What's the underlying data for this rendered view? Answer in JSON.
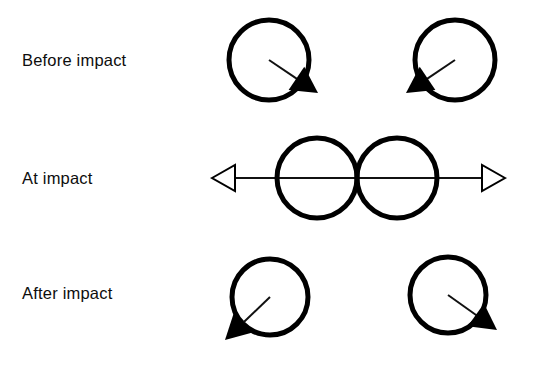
{
  "figure": {
    "background_color": "#ffffff",
    "ink_color": "#000000",
    "width": 546,
    "height": 374
  },
  "rows": [
    {
      "id": "before-impact",
      "label": "Before impact",
      "label_x": 22,
      "label_y": 66,
      "balls": [
        {
          "id": "before-left-ball",
          "cx": 269,
          "cy": 60,
          "r": 40,
          "arrow": {
            "id": "before-left-velocity-arrow",
            "from_x": 269,
            "from_y": 60,
            "to_x": 318,
            "to_y": 93,
            "head": "filled",
            "direction": "down-right"
          }
        },
        {
          "id": "before-right-ball",
          "cx": 455,
          "cy": 60,
          "r": 40,
          "arrow": {
            "id": "before-right-velocity-arrow",
            "from_x": 455,
            "from_y": 60,
            "to_x": 406,
            "to_y": 93,
            "head": "filled",
            "direction": "down-left"
          }
        }
      ]
    },
    {
      "id": "at-impact",
      "label": "At impact",
      "label_x": 22,
      "label_y": 184,
      "balls": [
        {
          "id": "at-impact-left-ball",
          "cx": 317,
          "cy": 178,
          "r": 40,
          "arrow": null
        },
        {
          "id": "at-impact-right-ball",
          "cx": 397,
          "cy": 178,
          "r": 40,
          "arrow": null
        }
      ],
      "axis": {
        "id": "line-of-impact-axis",
        "y": 178,
        "left_tip_x": 212,
        "right_tip_x": 505,
        "head": "hollow",
        "head_length": 23,
        "head_half_height": 13
      }
    },
    {
      "id": "after-impact",
      "label": "After impact",
      "label_x": 22,
      "label_y": 299,
      "balls": [
        {
          "id": "after-left-ball",
          "cx": 270,
          "cy": 297,
          "r": 38,
          "arrow": {
            "id": "after-left-velocity-arrow",
            "from_x": 270,
            "from_y": 297,
            "to_x": 225,
            "to_y": 340,
            "head": "filled",
            "direction": "down-left"
          }
        },
        {
          "id": "after-right-ball",
          "cx": 448,
          "cy": 295,
          "r": 38,
          "arrow": {
            "id": "after-right-velocity-arrow",
            "from_x": 448,
            "from_y": 295,
            "to_x": 497,
            "to_y": 330,
            "head": "filled",
            "direction": "down-right"
          }
        }
      ]
    }
  ],
  "style": {
    "circle_stroke_width": 5,
    "shaft_stroke_width": 2,
    "axis_stroke_width": 2,
    "filled_head_length": 26,
    "filled_head_half_height": 14
  }
}
